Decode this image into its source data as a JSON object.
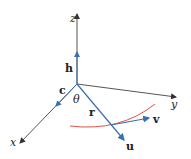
{
  "diagram": {
    "axes": {
      "z": "z",
      "y": "y",
      "x": "x"
    },
    "vectors": {
      "h": "h",
      "c": "c",
      "r": "r",
      "v": "v",
      "u": "u"
    },
    "angle": "θ",
    "colors": {
      "axis": "#333333",
      "vector": "#3a6fb0",
      "curve": "#e0504a"
    }
  }
}
